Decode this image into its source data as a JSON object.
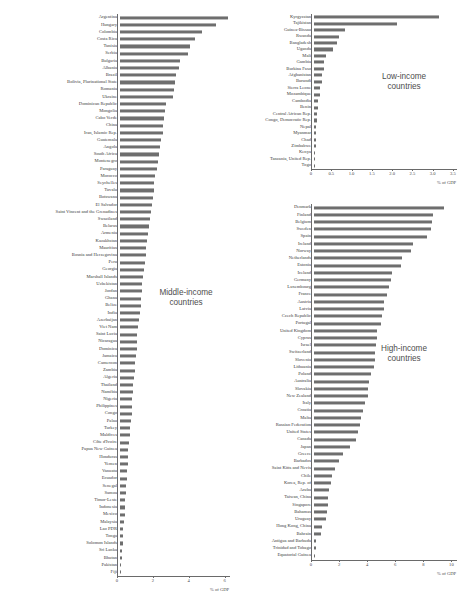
{
  "chart_data": [
    {
      "type": "bar",
      "title": "Middle-income countries",
      "xlabel": "% of GDP",
      "ylabel": "",
      "orientation": "horizontal",
      "xlim": [
        0,
        6.3
      ],
      "xticks": [
        0,
        2,
        4,
        6
      ],
      "xticklabels": [
        "0",
        "2",
        "4",
        "6"
      ],
      "grid": false,
      "legend": "none",
      "categories": [
        "Argentina",
        "Hungary",
        "Colombia",
        "Costa Rica",
        "Tunisia",
        "Serbia",
        "Bulgaria",
        "Albania",
        "Brazil",
        "Bolivia, Plurinational State",
        "Romania",
        "Ukraine",
        "Dominican Republic",
        "Mongolia",
        "Cabo Verde",
        "China",
        "Iran, Islamic Rep.",
        "Guatemala",
        "Angola",
        "South Africa",
        "Montenegro",
        "Paraguay",
        "Morocco",
        "Seychelles",
        "Tuvalu",
        "Botswana",
        "El Salvador",
        "Saint Vincent and the Grenadines",
        "Swaziland",
        "Belarus",
        "Armenia",
        "Kazakhstan",
        "Mauritius",
        "Bosnia and Herzegovina",
        "Peru",
        "Georgia",
        "Marshall Islands",
        "Uzbekistan",
        "Jordan",
        "Ghana",
        "Belize",
        "India",
        "Azerbaijan",
        "Viet Nam",
        "Saint Lucia",
        "Nicaragua",
        "Dominica",
        "Jamaica",
        "Cameroon",
        "Zambia",
        "Algeria",
        "Thailand",
        "Namibia",
        "Nigeria",
        "Philippines",
        "Congo",
        "Palau",
        "Turkey",
        "Maldives",
        "Côte d'Ivoire",
        "Papua New Guinea",
        "Honduras",
        "Yemen",
        "Vanuatu",
        "Ecuador",
        "Senegal",
        "Samoa",
        "Timor-Leste",
        "Indonesia",
        "Mexico",
        "Malaysia",
        "Lao PDR",
        "Tonga",
        "Solomon Islands",
        "Sri Lanka",
        "Bhutan",
        "Pakistan",
        "Fiji"
      ],
      "values": [
        6.05,
        5.4,
        4.6,
        4.2,
        3.95,
        3.8,
        3.4,
        3.3,
        3.15,
        3.1,
        3.05,
        3.0,
        2.6,
        2.55,
        2.5,
        2.45,
        2.4,
        2.3,
        2.25,
        2.2,
        2.15,
        2.1,
        2.0,
        1.95,
        1.9,
        1.85,
        1.8,
        1.78,
        1.7,
        1.65,
        1.6,
        1.55,
        1.5,
        1.45,
        1.4,
        1.35,
        1.3,
        1.28,
        1.25,
        1.2,
        1.18,
        1.15,
        1.1,
        1.05,
        1.0,
        0.98,
        0.95,
        0.9,
        0.88,
        0.85,
        0.8,
        0.78,
        0.75,
        0.72,
        0.7,
        0.68,
        0.65,
        0.6,
        0.58,
        0.55,
        0.5,
        0.48,
        0.45,
        0.42,
        0.4,
        0.38,
        0.35,
        0.32,
        0.3,
        0.28,
        0.25,
        0.22,
        0.2,
        0.18,
        0.15,
        0.12,
        0.1,
        0.08
      ]
    },
    {
      "type": "bar",
      "title": "Low-income countries",
      "xlabel": "% of GDP",
      "ylabel": "",
      "orientation": "horizontal",
      "xlim": [
        0,
        3.6
      ],
      "xticks": [
        0,
        0.5,
        1.0,
        1.5,
        2.0,
        2.5,
        3.0,
        3.5
      ],
      "xticklabels": [
        "0",
        "0.5",
        "1.0",
        "1.5",
        "2.0",
        "2.5",
        "3.0",
        "3.5"
      ],
      "grid": false,
      "legend": "none",
      "categories": [
        "Kyrgyzstan",
        "Tajikistan",
        "Guinea-Bissau",
        "Rwanda",
        "Bangladesh",
        "Uganda",
        "Mali",
        "Gambia",
        "Burkina Faso",
        "Afghanistan",
        "Burundi",
        "Sierra Leone",
        "Mozambique",
        "Cambodia",
        "Benin",
        "Central African Rep.",
        "Congo, Democratic Rep.",
        "Nepal",
        "Myanmar",
        "Chad",
        "Zimbabwe",
        "Kenya",
        "Tanzania, United Rep.",
        "Togo"
      ],
      "values": [
        3.1,
        2.05,
        0.78,
        0.62,
        0.58,
        0.48,
        0.3,
        0.27,
        0.25,
        0.22,
        0.2,
        0.17,
        0.16,
        0.12,
        0.11,
        0.09,
        0.08,
        0.07,
        0.06,
        0.055,
        0.05,
        0.045,
        0.04,
        0.03
      ]
    },
    {
      "type": "bar",
      "title": "High-income countries",
      "xlabel": "% of GDP",
      "ylabel": "",
      "orientation": "horizontal",
      "xlim": [
        0,
        10.4
      ],
      "xticks": [
        0,
        2,
        4,
        6,
        8,
        10
      ],
      "xticklabels": [
        "0",
        "2",
        "4",
        "6",
        "8",
        "10"
      ],
      "grid": false,
      "legend": "none",
      "categories": [
        "Denmark",
        "Finland",
        "Belgium",
        "Sweden",
        "Spain",
        "Ireland",
        "Norway",
        "Netherlands",
        "Estonia",
        "Iceland",
        "Germany",
        "Luxembourg",
        "France",
        "Austria",
        "Latvia",
        "Czech Republic",
        "Portugal",
        "United Kingdom",
        "Cyprus",
        "Israel",
        "Switzerland",
        "Slovenia",
        "Lithuania",
        "Poland",
        "Australia",
        "Slovakia",
        "New Zealand",
        "Italy",
        "Croatia",
        "Malta",
        "Russian Federation",
        "United States",
        "Canada",
        "Japan",
        "Greece",
        "Barbados",
        "Saint Kitts and Nevis",
        "Chile",
        "Korea, Rep. of",
        "Aruba",
        "Taiwan, China",
        "Singapore",
        "Bahamas",
        "Uruguay",
        "Hong Kong, China",
        "Bahrain",
        "Antigua and Barbuda",
        "Trinidad and Tobago",
        "Equatorial Guinea"
      ],
      "values": [
        9.3,
        8.5,
        8.45,
        8.4,
        8.1,
        7.1,
        6.95,
        6.3,
        6.2,
        5.6,
        5.5,
        5.4,
        5.2,
        5.05,
        5.0,
        4.85,
        4.8,
        4.55,
        4.5,
        4.45,
        4.4,
        4.35,
        4.3,
        4.1,
        3.95,
        3.9,
        3.85,
        3.7,
        3.5,
        3.4,
        3.3,
        3.15,
        3.0,
        2.6,
        2.1,
        1.85,
        1.55,
        1.3,
        1.25,
        1.1,
        1.05,
        1.0,
        0.95,
        0.9,
        0.6,
        0.5,
        0.2,
        0.18,
        0.12
      ]
    }
  ]
}
